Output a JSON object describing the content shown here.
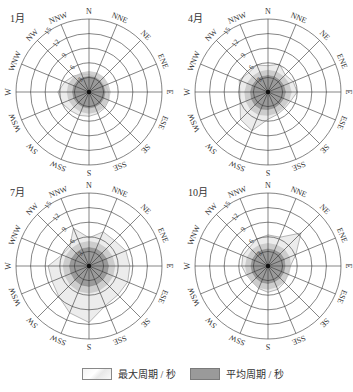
{
  "chart_data": [
    {
      "type": "polar-area",
      "title": "1月",
      "directions": [
        "N",
        "NNE",
        "NE",
        "ENE",
        "E",
        "ESE",
        "SE",
        "SSE",
        "S",
        "SSW",
        "SW",
        "WSW",
        "W",
        "WNW",
        "NW",
        "NNW"
      ],
      "radial_ticks": [
        3,
        6,
        9,
        12,
        15
      ],
      "rlim": [
        0,
        15
      ],
      "series": [
        {
          "name": "最大周期 / 秒",
          "values": [
            3.6,
            3.4,
            3.2,
            3.6,
            4.0,
            4.4,
            4.6,
            4.8,
            5.0,
            5.2,
            5.4,
            6.0,
            6.4,
            5.4,
            4.6,
            4.0
          ]
        },
        {
          "name": "平均周期 / 秒",
          "values": [
            3.2,
            3.2,
            3.2,
            3.2,
            3.3,
            3.3,
            3.3,
            3.3,
            3.3,
            3.3,
            3.3,
            3.4,
            3.4,
            3.4,
            3.3,
            3.2
          ]
        }
      ]
    },
    {
      "type": "polar-area",
      "title": "4月",
      "directions": [
        "N",
        "NNE",
        "NE",
        "ENE",
        "E",
        "ESE",
        "SE",
        "SSE",
        "S",
        "SSW",
        "SW",
        "WSW",
        "W",
        "WNW",
        "NW",
        "NNW"
      ],
      "radial_ticks": [
        3,
        6,
        9,
        12,
        15
      ],
      "rlim": [
        0,
        15
      ],
      "series": [
        {
          "name": "最大周期 / 秒",
          "values": [
            5.4,
            6.2,
            5.0,
            5.6,
            6.0,
            5.0,
            4.8,
            5.0,
            5.6,
            8.6,
            8.0,
            6.2,
            5.8,
            6.4,
            5.6,
            6.0
          ]
        },
        {
          "name": "平均周期 / 秒",
          "values": [
            3.4,
            3.4,
            3.4,
            3.5,
            3.6,
            3.5,
            3.4,
            3.5,
            3.6,
            3.8,
            3.8,
            3.7,
            3.6,
            3.5,
            3.4,
            3.4
          ]
        }
      ]
    },
    {
      "type": "polar-area",
      "title": "7月",
      "directions": [
        "N",
        "NNE",
        "NE",
        "ENE",
        "E",
        "ESE",
        "SE",
        "SSE",
        "S",
        "SSW",
        "SW",
        "WSW",
        "W",
        "WNW",
        "NW",
        "NNW"
      ],
      "radial_ticks": [
        3,
        6,
        9,
        12,
        15
      ],
      "rlim": [
        0,
        15
      ],
      "series": [
        {
          "name": "最大周期 / 秒",
          "values": [
            5.8,
            7.6,
            7.4,
            8.2,
            8.4,
            8.6,
            8.4,
            8.8,
            11.6,
            10.4,
            8.8,
            8.2,
            8.4,
            6.0,
            5.6,
            8.4
          ]
        },
        {
          "name": "平均周期 / 秒",
          "values": [
            3.8,
            3.8,
            3.8,
            3.9,
            4.0,
            4.0,
            4.0,
            4.1,
            4.2,
            4.2,
            4.1,
            4.0,
            4.0,
            3.9,
            3.8,
            3.8
          ]
        }
      ]
    },
    {
      "type": "polar-area",
      "title": "10月",
      "directions": [
        "N",
        "NNE",
        "NE",
        "ENE",
        "E",
        "ESE",
        "SE",
        "SSE",
        "S",
        "SSW",
        "SW",
        "WSW",
        "W",
        "WNW",
        "NW",
        "NNW"
      ],
      "radial_ticks": [
        3,
        6,
        9,
        12,
        15
      ],
      "rlim": [
        0,
        15
      ],
      "series": [
        {
          "name": "最大周期 / 秒",
          "values": [
            6.4,
            6.4,
            9.6,
            6.2,
            4.6,
            4.4,
            4.8,
            5.2,
            5.4,
            5.0,
            4.6,
            4.8,
            5.4,
            5.6,
            5.4,
            6.0
          ]
        },
        {
          "name": "平均周期 / 秒",
          "values": [
            3.5,
            3.5,
            3.6,
            3.6,
            3.5,
            3.5,
            3.5,
            3.5,
            3.6,
            3.6,
            3.5,
            3.5,
            3.5,
            3.5,
            3.5,
            3.5
          ]
        }
      ]
    }
  ],
  "legend": {
    "max_label": "最大周期 / 秒",
    "avg_label": "平均周期 / 秒"
  },
  "colors": {
    "max_fill": "#ececec",
    "avg_fill": "#9a9a9a",
    "mid_fill": "#c4c4c4",
    "grid": "#333333"
  }
}
